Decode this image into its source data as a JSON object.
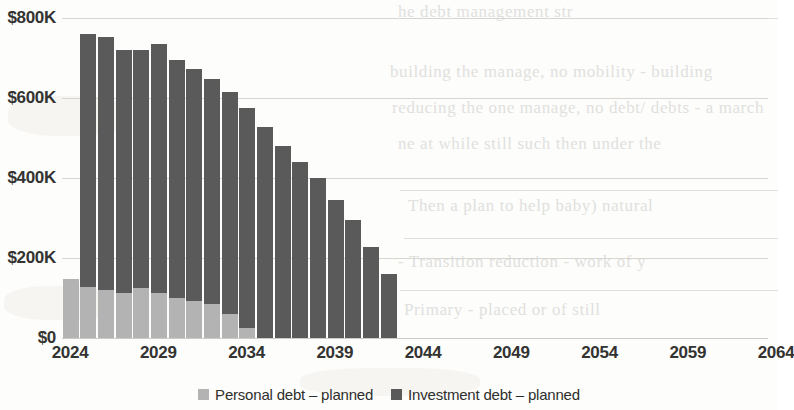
{
  "chart_data": {
    "type": "bar",
    "stacked": true,
    "title": "",
    "subtitle": "",
    "xlabel": "",
    "ylabel": "",
    "grid": true,
    "legend_position": "bottom",
    "xlim": [
      2024,
      2064
    ],
    "ylim": [
      0,
      800000
    ],
    "y_ticks": [
      0,
      200000,
      400000,
      600000,
      800000
    ],
    "y_tick_labels": [
      "$0",
      "$200K",
      "$400K",
      "$600K",
      "$800K"
    ],
    "x_ticks": [
      2024,
      2029,
      2034,
      2039,
      2044,
      2049,
      2054,
      2059,
      2064
    ],
    "x_tick_labels": [
      "2024",
      "2029",
      "2034",
      "2039",
      "2044",
      "2049",
      "2054",
      "2059",
      "2064"
    ],
    "categories": [
      2024,
      2025,
      2026,
      2027,
      2028,
      2029,
      2030,
      2031,
      2032,
      2033,
      2034,
      2035,
      2036,
      2037,
      2038,
      2039,
      2040,
      2041,
      2042
    ],
    "series": [
      {
        "name": "Personal debt – planned",
        "color": "#b3b3b3",
        "values": [
          148000,
          128000,
          120000,
          112000,
          124000,
          112000,
          100000,
          92000,
          84000,
          60000,
          24000,
          0,
          0,
          0,
          0,
          0,
          0,
          0,
          0
        ]
      },
      {
        "name": "Investment debt – planned",
        "color": "#5a5a5a",
        "values": [
          0,
          632000,
          632000,
          608000,
          596000,
          624000,
          596000,
          580000,
          564000,
          556000,
          552000,
          528000,
          480000,
          440000,
          400000,
          344000,
          296000,
          228000,
          160000
        ]
      }
    ],
    "totals": [
      148000,
      760000,
      752000,
      720000,
      720000,
      736000,
      696000,
      672000,
      648000,
      616000,
      576000,
      528000,
      480000,
      440000,
      400000,
      344000,
      296000,
      228000,
      160000
    ]
  },
  "legend": {
    "items": [
      {
        "label": "Personal debt – planned",
        "color": "#b3b3b3",
        "swatch_name": "legend-swatch-personal-debt"
      },
      {
        "label": "Investment debt – planned",
        "color": "#5a5a5a",
        "swatch_name": "legend-swatch-investment-debt"
      }
    ]
  },
  "background_text": {
    "lines": [
      "he debt management str",
      "building the manage, no mobility - building",
      "reducing the one manage, no debt/ debts - a march",
      "ne at while still such then under the",
      "Then a plan to help baby) natural",
      "- Transition reduction - work of y",
      "Primary - placed or of still",
      "Secondary - know as the as the anova"
    ]
  }
}
